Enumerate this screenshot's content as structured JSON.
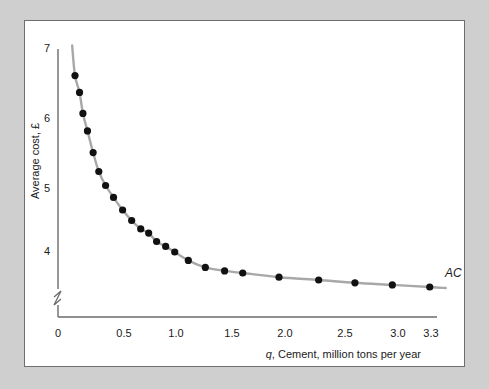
{
  "figure": {
    "background_color": "#cfcfcf",
    "panel_color": "#ffffff",
    "border_color": "#6e6e6e"
  },
  "chart_data": {
    "type": "scatter",
    "title": "",
    "subtitle": "",
    "xlabel_prefix": "q",
    "xlabel_rest": ", Cement, million tons per year",
    "xlabel": "q, Cement, million tons per year",
    "ylabel": "Average cost, £",
    "xlim": [
      0,
      3.45
    ],
    "ylim": [
      3.3,
      7.25
    ],
    "y_axis_break": true,
    "grid": false,
    "legend_position": "right-end-of-curve",
    "xticks": [
      0,
      0.5,
      1.0,
      1.5,
      2.0,
      2.5,
      3.0,
      3.3
    ],
    "xticklabels": [
      "0",
      "0.5",
      "1.0",
      "1.5",
      "2.0",
      "2.5",
      "3.0",
      "3.3"
    ],
    "yticks": [
      4,
      5,
      6,
      7
    ],
    "yticklabels": [
      "4",
      "5",
      "6",
      "7"
    ],
    "series": [
      {
        "name": "AC",
        "label": "AC",
        "marker": "filled-circle",
        "marker_color": "#111111",
        "line_color": "#a8a8a8",
        "x": [
          0.15,
          0.19,
          0.22,
          0.26,
          0.31,
          0.36,
          0.42,
          0.49,
          0.57,
          0.65,
          0.73,
          0.8,
          0.87,
          0.95,
          1.03,
          1.15,
          1.3,
          1.47,
          1.63,
          1.95,
          2.3,
          2.62,
          2.95,
          3.28
        ],
        "y": [
          6.62,
          6.38,
          6.08,
          5.83,
          5.52,
          5.25,
          5.05,
          4.88,
          4.7,
          4.55,
          4.43,
          4.37,
          4.25,
          4.18,
          4.1,
          3.98,
          3.88,
          3.83,
          3.8,
          3.74,
          3.7,
          3.66,
          3.63,
          3.6
        ]
      }
    ],
    "curve_formula_note": "AC declines steeply then flattens toward ~3.6"
  },
  "labels": {
    "series_label_ac": "AC",
    "y_axis_title": "Average cost, £",
    "x_axis_title_italic": "q",
    "x_axis_title_plain": ", Cement, million tons per year"
  }
}
